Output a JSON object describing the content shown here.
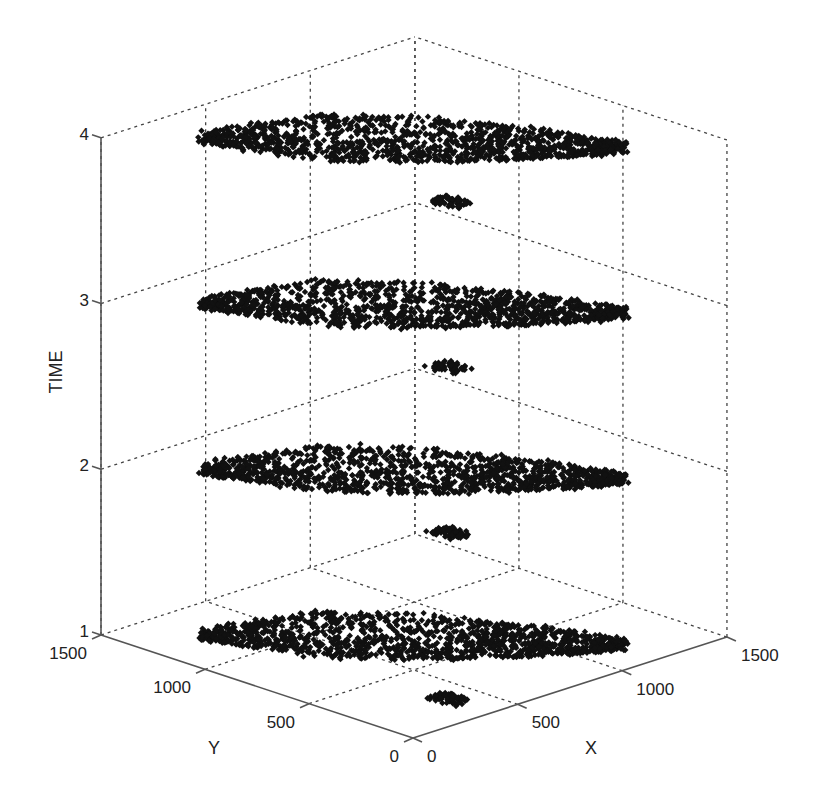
{
  "chart_data": {
    "type": "scatter",
    "subtype": "3d-scatter",
    "title": "",
    "xlabel": "X",
    "ylabel": "Y",
    "zlabel": "TIME",
    "xlim": [
      0,
      1500
    ],
    "ylim": [
      0,
      1500
    ],
    "zlim": [
      1,
      4
    ],
    "x_ticks": [
      0,
      500,
      1000,
      1500
    ],
    "y_ticks": [
      0,
      500,
      1000,
      1500
    ],
    "z_ticks": [
      1,
      2,
      3,
      4
    ],
    "x_tick_labels": [
      "0",
      "500",
      "1000",
      "1500"
    ],
    "y_tick_labels": [
      "0",
      "500",
      "1000",
      "1500"
    ],
    "z_tick_labels": [
      "1",
      "2",
      "3",
      "4"
    ],
    "grid": true,
    "legend": null,
    "marker": "diamond",
    "marker_color": "#111111",
    "layers": [
      {
        "time": 1,
        "description": "Point cloud spanning roughly X 250-1200, Y 180-1400 (diagonal band)"
      },
      {
        "time": 2,
        "description": "Same spatial cloud at TIME=2"
      },
      {
        "time": 3,
        "description": "Same spatial cloud at TIME=3"
      },
      {
        "time": 4,
        "description": "Same spatial cloud at TIME=4"
      }
    ],
    "cloud": {
      "axis_start": [
        250,
        1260
      ],
      "axis_end": [
        1190,
        180
      ],
      "half_width_profile": [
        60,
        150,
        230,
        260,
        240,
        210,
        170,
        120,
        60
      ],
      "approx_points_per_layer": 1300
    },
    "projection": {
      "origin_px": [
        413,
        738
      ],
      "x_unit_px": [
        0.2093,
        -0.0673
      ],
      "y_unit_px": [
        -0.208,
        -0.0687
      ],
      "z_unit_px": -165.7
    }
  }
}
